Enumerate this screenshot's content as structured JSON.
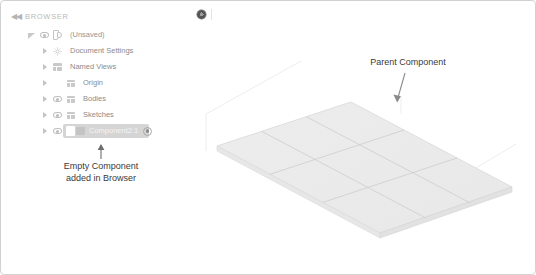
{
  "panel": {
    "title": "BROWSER",
    "collapse_icon": "collapse-left-icon",
    "gear_icon": "gear-icon"
  },
  "tree": {
    "items": [
      {
        "label": "(Unsaved)",
        "indent": 0,
        "expander": "triangle-filled",
        "has_eye": true,
        "icon": "component-document-icon",
        "selected": false
      },
      {
        "label": "Document Settings",
        "indent": 1,
        "expander": "triangle",
        "has_eye": false,
        "icon": "gear-icon",
        "selected": false
      },
      {
        "label": "Named Views",
        "indent": 1,
        "expander": "triangle",
        "has_eye": false,
        "icon": "folder-icon",
        "selected": false
      },
      {
        "label": "Origin",
        "indent": 1,
        "expander": "triangle",
        "has_eye": false,
        "icon": "folder-icon",
        "selected": false
      },
      {
        "label": "Bodies",
        "indent": 1,
        "expander": "triangle",
        "has_eye": true,
        "icon": "folder-icon",
        "selected": false
      },
      {
        "label": "Sketches",
        "indent": 1,
        "expander": "triangle",
        "has_eye": true,
        "icon": "folder-icon",
        "selected": false
      },
      {
        "label": "Component2:1",
        "indent": 1,
        "expander": "triangle",
        "has_eye": true,
        "icon": "component-icon",
        "selected": true,
        "trailing_icon": "activate-component-radio-icon"
      }
    ]
  },
  "annotations": {
    "left": {
      "line1": "Empty Component",
      "line2": "added in Browser"
    },
    "right": {
      "line1": "Parent Component"
    }
  },
  "canvas": {
    "grid_plane_name": "isometric-grid-plane",
    "colors": {
      "plane_fill": "#ededed",
      "plane_line": "#c8c8c8",
      "annotation_text": "#3b3b3b",
      "panel_text": "#8c8c8c",
      "selection": "#d5d5d5",
      "border": "#d2d2d2"
    }
  }
}
